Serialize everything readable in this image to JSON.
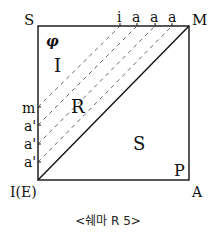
{
  "diagram": {
    "caption": "<쉐마 R 5>",
    "corners": {
      "top_left": "S",
      "top_right": "M",
      "bottom_left": "I(E)",
      "bottom_right": "A"
    },
    "regions": {
      "phi": "φ",
      "imaginary": "I",
      "real": "R",
      "symbolic": "S",
      "P": "P"
    },
    "top_edge_labels": [
      "i",
      "a",
      "a",
      "a"
    ],
    "left_edge_labels": [
      "m",
      "a'",
      "a'",
      "a'"
    ],
    "colors": {
      "line": "#111111",
      "dashed": "#555555",
      "background": "#ffffff"
    }
  }
}
